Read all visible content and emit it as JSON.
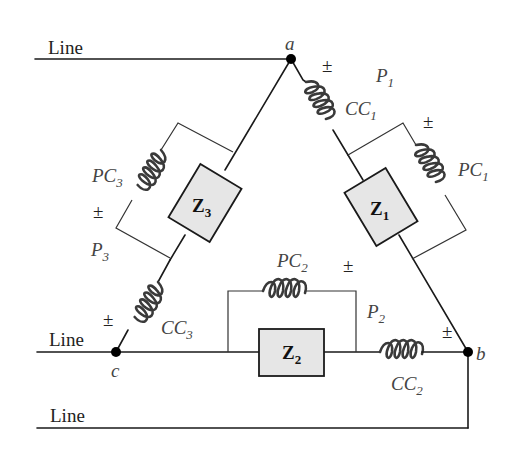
{
  "diagram": {
    "type": "three-phase-delta-wattmeter-circuit",
    "lines": [
      {
        "label": "Line",
        "position": "top",
        "connects_to": "a"
      },
      {
        "label": "Line",
        "position": "middle",
        "connects_to": "c"
      },
      {
        "label": "Line",
        "position": "bottom",
        "connects_to": "b"
      }
    ],
    "nodes": {
      "a": {
        "label": "a"
      },
      "b": {
        "label": "b"
      },
      "c": {
        "label": "c"
      }
    },
    "impedances": [
      {
        "id": "Z1",
        "main": "Z",
        "sub": "1",
        "branch": "a-b"
      },
      {
        "id": "Z2",
        "main": "Z",
        "sub": "2",
        "branch": "b-c"
      },
      {
        "id": "Z3",
        "main": "Z",
        "sub": "3",
        "branch": "c-a"
      }
    ],
    "wattmeters": [
      {
        "id": "P1",
        "main": "P",
        "sub": "1",
        "current_coil": {
          "main": "CC",
          "sub": "1"
        },
        "potential_coil": {
          "main": "PC",
          "sub": "1"
        }
      },
      {
        "id": "P2",
        "main": "P",
        "sub": "2",
        "current_coil": {
          "main": "CC",
          "sub": "2"
        },
        "potential_coil": {
          "main": "PC",
          "sub": "2"
        }
      },
      {
        "id": "P3",
        "main": "P",
        "sub": "3",
        "current_coil": {
          "main": "CC",
          "sub": "3"
        },
        "potential_coil": {
          "main": "PC",
          "sub": "3"
        }
      }
    ],
    "polarity_mark": "±",
    "colors": {
      "wire": "#1a1a1a",
      "coil": "#3a3a3a",
      "impedance_fill": "#e6e6e6",
      "label": "#444444"
    }
  }
}
